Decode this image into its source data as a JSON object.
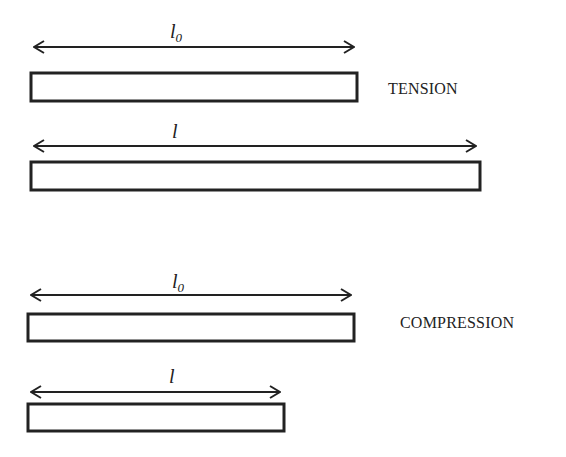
{
  "tension": {
    "caption": "TENSION",
    "original": {
      "symbol": "l",
      "subscript": "0"
    },
    "deformed": {
      "symbol": "l",
      "subscript": ""
    }
  },
  "compression": {
    "caption": "COMPRESSION",
    "original": {
      "symbol": "l",
      "subscript": "0"
    },
    "deformed": {
      "symbol": "l",
      "subscript": ""
    }
  },
  "colors": {
    "stroke": "#222222",
    "background": "#ffffff"
  }
}
